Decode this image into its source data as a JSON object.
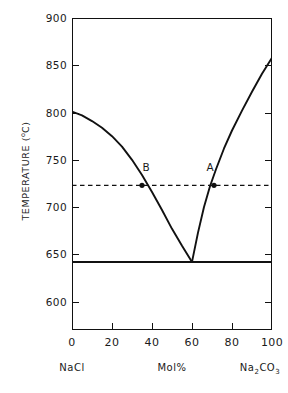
{
  "chart_data": {
    "type": "line",
    "title": "",
    "xlabel": "Mol%",
    "ylabel": "TEMPERATURE (°C)",
    "ylabel_text": "TEMPERATURE  (",
    "ylabel_sup": "o",
    "ylabel_tail": "C)",
    "xlim": [
      0,
      100
    ],
    "ylim": [
      570,
      900
    ],
    "grid": false,
    "legend": null,
    "x_ticks": [
      "0",
      "20",
      "40",
      "60",
      "80",
      "100"
    ],
    "x_tick_values": [
      0,
      20,
      40,
      60,
      80,
      100
    ],
    "y_ticks": [
      "900",
      "850",
      "800",
      "750",
      "700",
      "650",
      "600"
    ],
    "y_tick_values": [
      900,
      850,
      800,
      750,
      700,
      650,
      600
    ],
    "endpoint_labels": {
      "left": "NaCl",
      "left_value": 0,
      "center": "Mol%",
      "center_value": 50,
      "right": "Na2CO3",
      "right_main_1": "Na",
      "right_sub_1": "2",
      "right_main_2": "CO",
      "right_sub_2": "3",
      "right_value": 100
    },
    "series": [
      {
        "name": "NaCl liquidus",
        "style": "solid",
        "color": "#111111",
        "points": [
          [
            0,
            801
          ],
          [
            5,
            797
          ],
          [
            10,
            791
          ],
          [
            15,
            784
          ],
          [
            20,
            775
          ],
          [
            25,
            764
          ],
          [
            30,
            750
          ],
          [
            35,
            734
          ],
          [
            40,
            716
          ],
          [
            45,
            697
          ],
          [
            50,
            677
          ],
          [
            55,
            659
          ],
          [
            60,
            642
          ]
        ]
      },
      {
        "name": "Na2CO3 liquidus",
        "style": "solid",
        "color": "#111111",
        "points": [
          [
            60,
            642
          ],
          [
            63,
            673
          ],
          [
            66,
            700
          ],
          [
            69,
            722
          ],
          [
            72,
            740
          ],
          [
            76,
            762
          ],
          [
            80,
            781
          ],
          [
            85,
            802
          ],
          [
            90,
            822
          ],
          [
            95,
            841
          ],
          [
            100,
            858
          ]
        ]
      },
      {
        "name": "eutectic solidus",
        "style": "solid",
        "color": "#111111",
        "points": [
          [
            0,
            642
          ],
          [
            100,
            642
          ]
        ]
      },
      {
        "name": "isotherm",
        "style": "dashed",
        "color": "#111111",
        "points": [
          [
            0,
            723
          ],
          [
            100,
            723
          ]
        ]
      }
    ],
    "annotations": [
      {
        "label": "B",
        "x": 35,
        "y": 723,
        "marker": true,
        "label_offset_x": 4,
        "label_offset_y": 24
      },
      {
        "label": "A",
        "x": 71,
        "y": 723,
        "marker": true,
        "label_offset_x": -4,
        "label_offset_y": 24
      }
    ]
  }
}
